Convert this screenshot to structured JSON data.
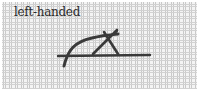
{
  "diagram": {
    "label": "left-handed",
    "colors": {
      "thread": "#3a3a3a",
      "canvas_bg": "#f4f4f4",
      "canvas_grid": "#c9c9c9",
      "label": "#2a2a2a"
    },
    "elements": [
      {
        "name": "curved-thread",
        "description": "curve arching from lower-left up to the right"
      },
      {
        "name": "cross-stitch",
        "description": "X crossing near top center"
      },
      {
        "name": "horizontal-thread",
        "description": "straight horizontal thread line"
      }
    ]
  }
}
